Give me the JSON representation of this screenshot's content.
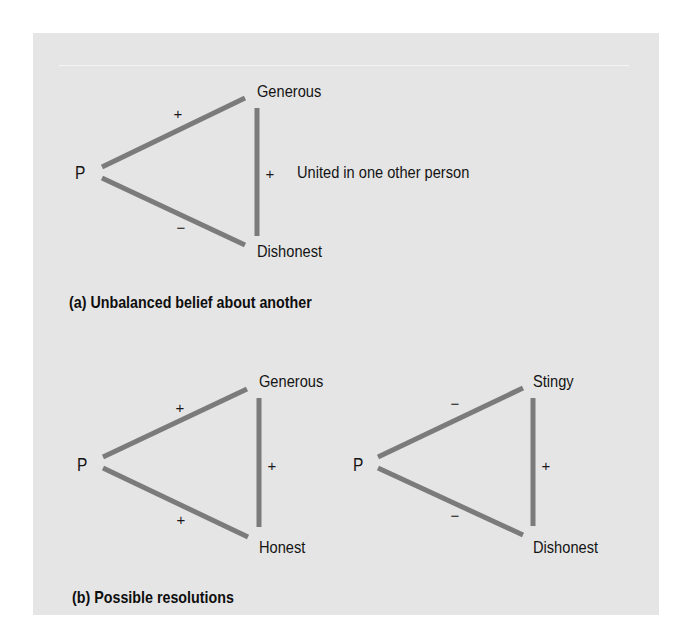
{
  "figure": {
    "panel_a": {
      "caption": "(a) Unbalanced belief about another",
      "note": "United in one other person",
      "nodes": {
        "person": "P",
        "top": "Generous",
        "bottom": "Dishonest"
      },
      "signs": {
        "p_top": "+",
        "p_bottom": "−",
        "top_bottom": "+"
      }
    },
    "panel_b": {
      "caption": "(b) Possible resolutions",
      "resolution_1": {
        "nodes": {
          "person": "P",
          "top": "Generous",
          "bottom": "Honest"
        },
        "signs": {
          "p_top": "+",
          "p_bottom": "+",
          "top_bottom": "+"
        }
      },
      "resolution_2": {
        "nodes": {
          "person": "P",
          "top": "Stingy",
          "bottom": "Dishonest"
        },
        "signs": {
          "p_top": "−",
          "p_bottom": "−",
          "top_bottom": "+"
        }
      }
    },
    "colors": {
      "background": "#e5e5e5",
      "edge": "#7b7b7b",
      "text": "#141414"
    }
  }
}
